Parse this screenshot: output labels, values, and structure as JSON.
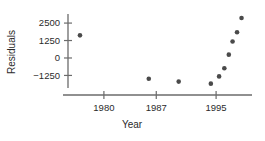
{
  "chart_data": {
    "type": "scatter",
    "title": "",
    "xlabel": "Year",
    "ylabel": "Residuals",
    "xlim": [
      1975.2,
      1999.8
    ],
    "ylim": [
      -2150,
      3150
    ],
    "grid": false,
    "legend": null,
    "xticks": [
      1980,
      1987,
      1995
    ],
    "xticklabels": [
      "1980",
      "1987",
      "1995"
    ],
    "yticks": [
      -1250,
      0,
      1250,
      2500
    ],
    "yticklabels": [
      "-1250",
      "0",
      "1250",
      "2500"
    ],
    "marker": "filled-circle",
    "marker_color": "#4a4a4a",
    "points": [
      {
        "x": 1976.8,
        "y": 1620
      },
      {
        "x": 1986.0,
        "y": -1490
      },
      {
        "x": 1990.0,
        "y": -1690
      },
      {
        "x": 1994.3,
        "y": -1840
      },
      {
        "x": 1995.4,
        "y": -1320
      },
      {
        "x": 1996.1,
        "y": -740
      },
      {
        "x": 1996.7,
        "y": 240
      },
      {
        "x": 1997.2,
        "y": 1180
      },
      {
        "x": 1997.8,
        "y": 1840
      },
      {
        "x": 1998.4,
        "y": 2860
      }
    ]
  },
  "axes": {
    "y_title": "Residuals",
    "x_title": "Year"
  }
}
